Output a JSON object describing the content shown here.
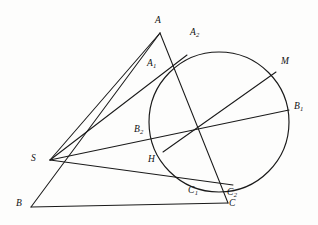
{
  "figure": {
    "kind": "euclidean-geometry-diagram",
    "background_color": "#fdfdfc",
    "ink_color": "#1a1a1a",
    "canvas": {
      "width": 318,
      "height": 225
    }
  },
  "labels": {
    "A": {
      "text": "A",
      "sub": "",
      "x": 155,
      "y": 16
    },
    "A1": {
      "text": "A",
      "sub": "1",
      "x": 147,
      "y": 59
    },
    "A2": {
      "text": "A",
      "sub": "2",
      "x": 190,
      "y": 28
    },
    "M": {
      "text": "M",
      "sub": "",
      "x": 281,
      "y": 57
    },
    "B1": {
      "text": "B",
      "sub": "1",
      "x": 294,
      "y": 102
    },
    "B2": {
      "text": "B",
      "sub": "2",
      "x": 134,
      "y": 125
    },
    "S": {
      "text": "S",
      "sub": "",
      "x": 31,
      "y": 154
    },
    "H": {
      "text": "H",
      "sub": "",
      "x": 148,
      "y": 155
    },
    "C1": {
      "text": "C",
      "sub": "1",
      "x": 188,
      "y": 186
    },
    "C2": {
      "text": "C",
      "sub": "2",
      "x": 227,
      "y": 188
    },
    "B": {
      "text": "B",
      "sub": "",
      "x": 16,
      "y": 199
    },
    "C": {
      "text": "C",
      "sub": "",
      "x": 229,
      "y": 199
    }
  },
  "points": {
    "A": {
      "x": 160,
      "y": 33
    },
    "A1": {
      "x": 161,
      "y": 72
    },
    "A2": {
      "x": 186,
      "y": 56
    },
    "M": {
      "x": 276,
      "y": 72
    },
    "B1": {
      "x": 289,
      "y": 110
    },
    "B2": {
      "x": 153,
      "y": 134
    },
    "S": {
      "x": 50,
      "y": 160
    },
    "H": {
      "x": 163,
      "y": 152
    },
    "C1": {
      "x": 196,
      "y": 183
    },
    "C2": {
      "x": 232,
      "y": 185
    },
    "B": {
      "x": 31,
      "y": 207
    },
    "C": {
      "x": 228,
      "y": 203
    },
    "X": {
      "x": 196,
      "y": 132
    }
  },
  "circle": {
    "cx": 219,
    "cy": 122,
    "r": 70
  },
  "segments": [
    {
      "name": "side-AB",
      "from": "A",
      "to": "B"
    },
    {
      "name": "side-BC",
      "from": "B",
      "to": "C"
    },
    {
      "name": "cevian-A-to-C",
      "from": "A",
      "to": "C"
    },
    {
      "name": "line-S-to-A",
      "from": "S",
      "to": "A"
    },
    {
      "name": "line-S-to-A2",
      "from": "S",
      "to": "A2"
    },
    {
      "name": "line-S-to-B1",
      "from": "S",
      "to": "B1"
    },
    {
      "name": "line-S-to-C2",
      "from": "S",
      "to": "C2"
    },
    {
      "name": "line-H-to-M",
      "from": "H",
      "to": "M"
    }
  ]
}
